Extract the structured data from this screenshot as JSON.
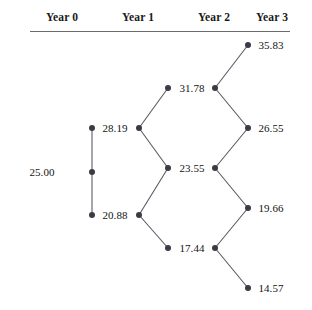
{
  "diagram": {
    "type": "binomial-tree",
    "title": "",
    "steps": 3,
    "headers": [
      {
        "label": "Year 0",
        "x": 62
      },
      {
        "label": "Year 1",
        "x": 138
      },
      {
        "label": "Year 2",
        "x": 214
      },
      {
        "label": "Year 3",
        "x": 272
      }
    ],
    "colors": {
      "node": "#3b3b45",
      "edge": "#5a5a66",
      "text": "#131313",
      "rule": "#6a6a6a",
      "background": "#ffffff"
    },
    "columns": [
      {
        "year": 0,
        "label": "Year 0",
        "nodes": [
          {
            "value": "25.00",
            "label_x": 42,
            "label_y": 172,
            "dot_in_x": null,
            "dot_out_x": 92,
            "y": 172
          }
        ]
      },
      {
        "year": 1,
        "label": "Year 1",
        "nodes": [
          {
            "value": "28.19",
            "label_x": 115,
            "label_y": 128,
            "dot_in_x": 92,
            "dot_out_x": 139,
            "y": 128
          },
          {
            "value": "20.88",
            "label_x": 115,
            "label_y": 215,
            "dot_in_x": 92,
            "dot_out_x": 139,
            "y": 215
          }
        ]
      },
      {
        "year": 2,
        "label": "Year 2",
        "nodes": [
          {
            "value": "31.78",
            "label_x": 192,
            "label_y": 88,
            "dot_in_x": 168,
            "dot_out_x": 215,
            "y": 88
          },
          {
            "value": "23.55",
            "label_x": 192,
            "label_y": 168,
            "dot_in_x": 168,
            "dot_out_x": 215,
            "y": 168
          },
          {
            "value": "17.44",
            "label_x": 192,
            "label_y": 248,
            "dot_in_x": 168,
            "dot_out_x": 215,
            "y": 248
          }
        ]
      },
      {
        "year": 3,
        "label": "Year 3",
        "nodes": [
          {
            "value": "35.83",
            "label_x": 271,
            "label_y": 45,
            "dot_in_x": 248,
            "dot_out_x": null,
            "y": 45
          },
          {
            "value": "26.55",
            "label_x": 271,
            "label_y": 128,
            "dot_in_x": 248,
            "dot_out_x": null,
            "y": 128
          },
          {
            "value": "19.66",
            "label_x": 271,
            "label_y": 208,
            "dot_in_x": 248,
            "dot_out_x": null,
            "y": 208
          },
          {
            "value": "14.57",
            "label_x": 271,
            "label_y": 288,
            "dot_in_x": 248,
            "dot_out_x": null,
            "y": 288
          }
        ]
      }
    ],
    "edges": [
      {
        "from": "25.00",
        "to": "28.19",
        "x1": 92,
        "y1": 172,
        "x2": 92,
        "y2": 128
      },
      {
        "from": "25.00",
        "to": "20.88",
        "x1": 92,
        "y1": 172,
        "x2": 92,
        "y2": 215
      },
      {
        "from": "28.19",
        "to": "31.78",
        "x1": 139,
        "y1": 128,
        "x2": 168,
        "y2": 88
      },
      {
        "from": "28.19",
        "to": "23.55",
        "x1": 139,
        "y1": 128,
        "x2": 168,
        "y2": 168
      },
      {
        "from": "20.88",
        "to": "23.55",
        "x1": 139,
        "y1": 215,
        "x2": 168,
        "y2": 168
      },
      {
        "from": "20.88",
        "to": "17.44",
        "x1": 139,
        "y1": 215,
        "x2": 168,
        "y2": 248
      },
      {
        "from": "31.78",
        "to": "35.83",
        "x1": 215,
        "y1": 88,
        "x2": 248,
        "y2": 45
      },
      {
        "from": "31.78",
        "to": "26.55",
        "x1": 215,
        "y1": 88,
        "x2": 248,
        "y2": 128
      },
      {
        "from": "23.55",
        "to": "26.55",
        "x1": 215,
        "y1": 168,
        "x2": 248,
        "y2": 128
      },
      {
        "from": "23.55",
        "to": "19.66",
        "x1": 215,
        "y1": 168,
        "x2": 248,
        "y2": 208
      },
      {
        "from": "17.44",
        "to": "19.66",
        "x1": 215,
        "y1": 248,
        "x2": 248,
        "y2": 208
      },
      {
        "from": "17.44",
        "to": "14.57",
        "x1": 215,
        "y1": 248,
        "x2": 248,
        "y2": 288
      }
    ]
  }
}
